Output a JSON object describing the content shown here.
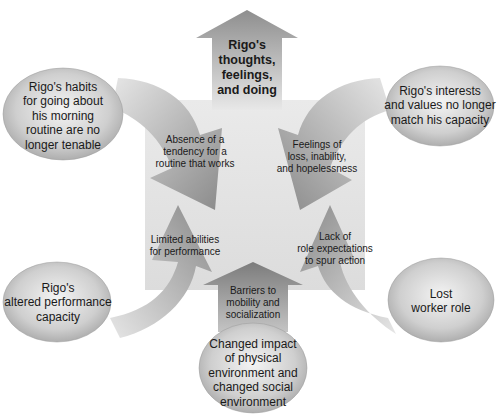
{
  "diagram": {
    "top_clipped_fragment": "",
    "center_output": "Rigo's thoughts, feelings, and doing",
    "nodes": [
      {
        "id": "habits",
        "label": "Rigo's habits for going about his morning routine are no longer tenable",
        "lines": [
          "Rigo's habits",
          "for going about",
          "his morning",
          "routine are no",
          "longer tenable"
        ]
      },
      {
        "id": "interests",
        "label": "Rigo's interests and values no longer match his capacity",
        "lines": [
          "Rigo's interests",
          "and values no longer",
          "match his capacity"
        ]
      },
      {
        "id": "performance",
        "label": "Rigo's altered performance capacity",
        "lines": [
          "Rigo's",
          "altered performance",
          "capacity"
        ]
      },
      {
        "id": "role",
        "label": "Lost worker role",
        "lines": [
          "Lost",
          "worker role"
        ]
      },
      {
        "id": "environment",
        "label": "Changed impact of physical environment and changed social environment",
        "lines": [
          "Changed impact",
          "of physical",
          "environment and",
          "changed social",
          "environment"
        ]
      }
    ],
    "arrows": [
      {
        "id": "routine",
        "from": "habits",
        "lines": [
          "Absence of a",
          "tendency for a",
          "routine that works"
        ]
      },
      {
        "id": "feelings",
        "from": "interests",
        "lines": [
          "Feelings of",
          "loss, inability,",
          "and hopelessness"
        ]
      },
      {
        "id": "abilities",
        "from": "performance",
        "lines": [
          "Limited abilities",
          "for performance"
        ]
      },
      {
        "id": "expectations",
        "from": "role",
        "lines": [
          "Lack of",
          "role expectations",
          "to spur action"
        ]
      },
      {
        "id": "barriers",
        "from": "environment",
        "lines": [
          "Barriers to",
          "mobility and",
          "socialization"
        ]
      }
    ],
    "top_arrow_lines": [
      "Rigo's",
      "thoughts,",
      "feelings,",
      "and doing"
    ],
    "colors": {
      "background": "#ffffff",
      "center_square": "#e4e4e4",
      "arrow_dark": "#8f8f8f",
      "arrow_light": "#e0e0e0",
      "ellipse_light": "#f2f2f2",
      "ellipse_dark": "#a8a8a8",
      "text": "#1a1a1a"
    }
  }
}
